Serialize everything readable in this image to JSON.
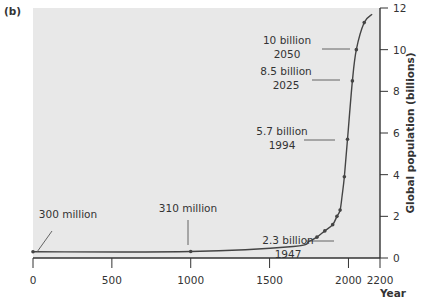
{
  "panel_label": "(b)",
  "chart_data": {
    "type": "line",
    "title": "",
    "xlabel": "Year",
    "ylabel": "Global population (billions)",
    "xlim": [
      0,
      2200
    ],
    "ylim": [
      0,
      12
    ],
    "x_ticks": [
      0,
      500,
      1000,
      1500,
      2000,
      2200
    ],
    "y_ticks": [
      0,
      2,
      4,
      6,
      8,
      10,
      12
    ],
    "y_axis_position": "right",
    "grid": false,
    "background": "#e8e8e8",
    "series": [
      {
        "name": "Global population",
        "x": [
          0,
          1000,
          1650,
          1750,
          1800,
          1850,
          1900,
          1927,
          1947,
          1960,
          1974,
          1994,
          2025,
          2050,
          2100,
          2150
        ],
        "values": [
          0.3,
          0.31,
          0.55,
          0.8,
          1.0,
          1.3,
          1.6,
          2.0,
          2.3,
          3.0,
          3.9,
          5.7,
          8.5,
          10.0,
          11.3,
          11.7
        ]
      }
    ],
    "markers": [
      {
        "x": 0,
        "y": 0.3
      },
      {
        "x": 1000,
        "y": 0.31
      },
      {
        "x": 1800,
        "y": 1.0
      },
      {
        "x": 1850,
        "y": 1.3
      },
      {
        "x": 1900,
        "y": 1.6
      },
      {
        "x": 1927,
        "y": 2.0
      },
      {
        "x": 1947,
        "y": 2.3
      },
      {
        "x": 1974,
        "y": 3.9
      },
      {
        "x": 1994,
        "y": 5.7
      },
      {
        "x": 2025,
        "y": 8.5
      },
      {
        "x": 2050,
        "y": 10.0
      },
      {
        "x": 2100,
        "y": 11.3
      }
    ],
    "annotations": [
      {
        "lines": [
          "300 million"
        ],
        "x": 0,
        "y": 0.3
      },
      {
        "lines": [
          "310 million"
        ],
        "x": 1000,
        "y": 0.31
      },
      {
        "lines": [
          "2.3 billion",
          "1947"
        ],
        "x": 1947,
        "y": 2.3
      },
      {
        "lines": [
          "5.7 billion",
          "1994"
        ],
        "x": 1994,
        "y": 5.7
      },
      {
        "lines": [
          "8.5 billion",
          "2025"
        ],
        "x": 2025,
        "y": 8.5
      },
      {
        "lines": [
          "10 billion",
          "2050"
        ],
        "x": 2050,
        "y": 10.0
      }
    ]
  }
}
